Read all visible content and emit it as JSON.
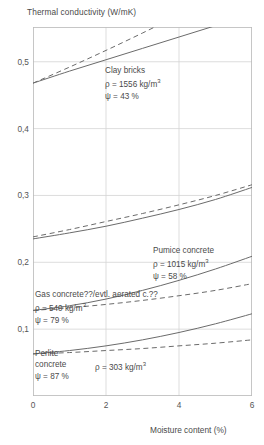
{
  "chart_data": {
    "type": "line",
    "title": "Thermal conductivity (W/mK)",
    "xlabel": "Moisture content (%)",
    "ylabel": "Thermal conductivity (W/mK)",
    "xlim": [
      0,
      6
    ],
    "ylim": [
      0,
      0.552
    ],
    "grid": true,
    "legend": "inline-annotations",
    "xticks": [
      "0",
      "2",
      "4",
      "6"
    ],
    "xtick_values": [
      0,
      2,
      4,
      6
    ],
    "yticks": [
      "0,1",
      "0,2",
      "0,3",
      "0,4",
      "0,5"
    ],
    "ytick_values": [
      0.1,
      0.2,
      0.3,
      0.4,
      0.5
    ],
    "decimal_separator": ",",
    "x": [
      0,
      1,
      2,
      3,
      4,
      5,
      6
    ],
    "series": [
      {
        "name": "Clay bricks (solid)",
        "material": "Clay bricks",
        "style": "solid",
        "values": [
          0.468,
          0.486,
          0.503,
          0.52,
          0.537,
          0.554,
          0.571
        ]
      },
      {
        "name": "Clay bricks (dashed)",
        "material": "Clay bricks",
        "style": "dashed",
        "values": [
          0.468,
          0.492,
          0.517,
          0.543,
          0.57,
          0.598,
          0.627
        ]
      },
      {
        "name": "Pumice concrete (solid)",
        "material": "Pumice concrete",
        "style": "solid",
        "values": [
          0.235,
          0.244,
          0.254,
          0.266,
          0.279,
          0.294,
          0.312
        ]
      },
      {
        "name": "Pumice concrete (dashed)",
        "material": "Pumice concrete",
        "style": "dashed",
        "values": [
          0.238,
          0.249,
          0.261,
          0.273,
          0.286,
          0.3,
          0.316
        ]
      },
      {
        "name": "Gas concrete (solid)",
        "material": "Gas concrete",
        "style": "solid",
        "values": [
          0.128,
          0.135,
          0.145,
          0.158,
          0.173,
          0.19,
          0.209
        ]
      },
      {
        "name": "Gas concrete (dashed)",
        "material": "Gas concrete",
        "style": "dashed",
        "values": [
          0.128,
          0.132,
          0.137,
          0.143,
          0.15,
          0.158,
          0.168
        ]
      },
      {
        "name": "Perlite concrete (solid)",
        "material": "Perlite concrete",
        "style": "solid",
        "values": [
          0.063,
          0.068,
          0.075,
          0.084,
          0.095,
          0.108,
          0.123
        ]
      },
      {
        "name": "Perlite concrete (dashed)",
        "material": "Perlite concrete",
        "style": "dashed",
        "values": [
          0.063,
          0.065,
          0.068,
          0.071,
          0.075,
          0.079,
          0.084
        ]
      }
    ],
    "annotations": [
      {
        "id": "clay-bricks",
        "name": "Clay bricks",
        "density": "ρ = 1556 kg/m",
        "density_exp": "3",
        "psi": "ψ = 43 %"
      },
      {
        "id": "pumice-concrete",
        "name": "Pumice concrete",
        "density": "ρ = 1015 kg/m",
        "density_exp": "3",
        "psi": "ψ = 58 %"
      },
      {
        "id": "gas-concrete",
        "name": "Gas concrete??/evtl. aerated c.??",
        "density": "ρ = 540 kg/m",
        "density_exp": "3",
        "psi": "ψ = 79 %"
      },
      {
        "id": "perlite-concrete",
        "name_line1": "Perlite",
        "name_line2": "concrete",
        "density": "ρ = 303 kg/m",
        "density_exp": "3",
        "psi": "ψ = 87 %"
      }
    ],
    "colors": {
      "line": "#6b6b6b",
      "grid": "#d4d4d4",
      "frame": "#bcbcbc",
      "text": "#4a4a4a"
    }
  }
}
